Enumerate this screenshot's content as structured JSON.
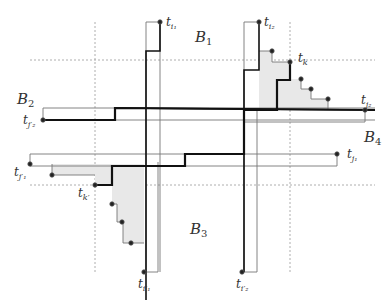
{
  "diagram": {
    "region_labels": {
      "B1": {
        "main": "B",
        "sub": "1"
      },
      "B2": {
        "main": "B",
        "sub": "2"
      },
      "B3": {
        "main": "B",
        "sub": "3"
      },
      "B4": {
        "main": "B",
        "sub": "4"
      }
    },
    "point_labels": {
      "ti1": {
        "main": "t",
        "sub": "i₁"
      },
      "ti2": {
        "main": "t",
        "sub": "i₂"
      },
      "tk": {
        "main": "t",
        "sub": "k"
      },
      "tj2": {
        "main": "t",
        "sub": "j₂"
      },
      "tj2p": {
        "main": "t",
        "sub": "j′₂"
      },
      "tj1": {
        "main": "t",
        "sub": "j₁"
      },
      "tj1p": {
        "main": "t",
        "sub": "j′₁"
      },
      "tkp": {
        "main": "t",
        "sub": "k′"
      },
      "ti1p": {
        "main": "t",
        "sub": "i′₁"
      },
      "ti2p": {
        "main": "t",
        "sub": "i′₂"
      }
    },
    "colors": {
      "thick_line": "#111111",
      "thin_line": "#777777",
      "dashed_line": "#999999",
      "shaded_region": "#e6e6e6"
    }
  }
}
